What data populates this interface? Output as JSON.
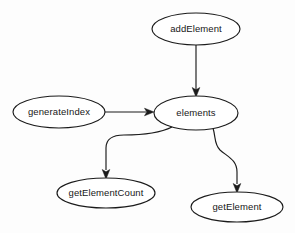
{
  "diagram": {
    "type": "directed-graph",
    "title": "",
    "background_color": "#fdfdfd",
    "node_fill_color": "#ffffff",
    "stroke_color": "#1b1b1b",
    "nodes": [
      {
        "id": "addElement",
        "label": "addElement",
        "shape": "ellipse",
        "cx": 196,
        "cy": 29,
        "rx": 44,
        "ry": 16
      },
      {
        "id": "generateIndex",
        "label": "generateIndex",
        "shape": "ellipse",
        "cx": 59,
        "cy": 112,
        "rx": 46,
        "ry": 16
      },
      {
        "id": "elements",
        "label": "elements",
        "shape": "ellipse",
        "cx": 196,
        "cy": 113,
        "rx": 42,
        "ry": 17
      },
      {
        "id": "getElementCount",
        "label": "getElementCount",
        "shape": "ellipse",
        "cx": 106,
        "cy": 193,
        "rx": 49,
        "ry": 15
      },
      {
        "id": "getElement",
        "label": "getElement",
        "shape": "ellipse",
        "cx": 237,
        "cy": 207,
        "rx": 46,
        "ry": 15
      }
    ],
    "edges": [
      {
        "id": "addElement-to-elements",
        "from": "addElement",
        "to": "elements",
        "directed": true,
        "style": "straight-vertical"
      },
      {
        "id": "generateIndex-to-elements",
        "from": "generateIndex",
        "to": "elements",
        "directed": true,
        "style": "straight-horizontal"
      },
      {
        "id": "elements-to-getElementCount",
        "from": "elements",
        "to": "getElementCount",
        "directed": true,
        "style": "orthogonal-curve-left"
      },
      {
        "id": "elements-to-getElement",
        "from": "elements",
        "to": "getElement",
        "directed": true,
        "style": "s-curve-right"
      }
    ]
  }
}
